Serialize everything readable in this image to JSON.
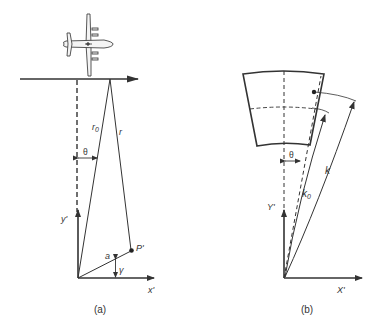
{
  "figure": {
    "panels": [
      {
        "id": "a",
        "caption": "(a)",
        "labels": {
          "r0": "r",
          "r0_sub": "0",
          "r": "r",
          "theta": "θ",
          "y_axis": "y'",
          "x_axis": "x'",
          "point": "P'",
          "a": "a",
          "gamma": "γ"
        }
      },
      {
        "id": "b",
        "caption": "(b)",
        "labels": {
          "theta": "θ",
          "y_axis": "Y'",
          "x_axis": "X'",
          "k0": "k",
          "k0_sub": "0",
          "k": "k"
        }
      }
    ],
    "colors": {
      "line": "#333333",
      "background": "#ffffff"
    }
  }
}
